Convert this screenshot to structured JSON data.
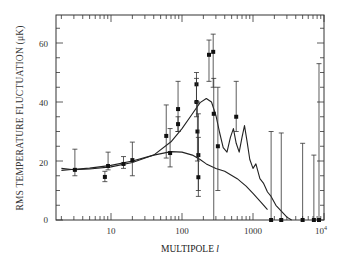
{
  "chart_data": {
    "type": "scatter",
    "title": "",
    "xlabel": "MULTIPOLE l",
    "ylabel": "RMS TEMPERATURE FLUCTUATION (μK)",
    "xscale": "log",
    "xlim": [
      1.7,
      10000
    ],
    "ylim": [
      0,
      69
    ],
    "x_ticks": [
      10,
      100,
      1000,
      10000
    ],
    "x_tick_labels": [
      "10",
      "100",
      "1000",
      "10⁴"
    ],
    "y_ticks": [
      0,
      20,
      40,
      60
    ],
    "y_tick_labels": [
      "0",
      "20",
      "40",
      "60"
    ],
    "grid": false,
    "legend": null,
    "series": [
      {
        "name": "measurements",
        "kind": "points_with_errorbars",
        "points": [
          {
            "l": 3.1,
            "T": 17.0,
            "lo": 15.0,
            "hi": 24.0
          },
          {
            "l": 8.2,
            "T": 14.6,
            "lo": 13.0,
            "hi": 16.5
          },
          {
            "l": 9.1,
            "T": 18.3,
            "lo": 17.0,
            "hi": 23.0
          },
          {
            "l": 15,
            "T": 19.0,
            "lo": 17.5,
            "hi": 21.5
          },
          {
            "l": 20,
            "T": 20.3,
            "lo": 15.0,
            "hi": 26.4
          },
          {
            "l": 60,
            "T": 28.5,
            "lo": 21.0,
            "hi": 39.0
          },
          {
            "l": 68,
            "T": 22.7,
            "lo": 18.0,
            "hi": 31.0
          },
          {
            "l": 88,
            "T": 37.6,
            "lo": 30.0,
            "hi": 47.0
          },
          {
            "l": 88,
            "T": 32.5,
            "lo": 30.0,
            "hi": 35.0
          },
          {
            "l": 160,
            "T": 46.0,
            "lo": 40.0,
            "hi": 50.0
          },
          {
            "l": 160,
            "T": 40.0,
            "lo": 35.0,
            "hi": 48.0
          },
          {
            "l": 165,
            "T": 30.0,
            "lo": 20.0,
            "hi": 40.0
          },
          {
            "l": 170,
            "T": 22.0,
            "lo": 8.0,
            "hi": 36.0
          },
          {
            "l": 170,
            "T": 14.5,
            "lo": 10.0,
            "hi": 28.0
          },
          {
            "l": 240,
            "T": 56.0,
            "lo": 47.0,
            "hi": 61.0
          },
          {
            "l": 275,
            "T": 57.0,
            "lo": 45.0,
            "hi": 63.0
          },
          {
            "l": 280,
            "T": 36.0,
            "lo": 0.0,
            "hi": 48.0
          },
          {
            "l": 320,
            "T": 25.0,
            "lo": 10.0,
            "hi": 45.0
          },
          {
            "l": 580,
            "T": 35.0,
            "lo": 30.0,
            "hi": 47.0
          },
          {
            "l": 1800,
            "T": 0.0,
            "lo": 0.0,
            "hi": 30.0
          },
          {
            "l": 2500,
            "T": 0.0,
            "lo": 0.0,
            "hi": 29.5
          },
          {
            "l": 5000,
            "T": 0.0,
            "lo": 0.0,
            "hi": 26.0
          },
          {
            "l": 7200,
            "T": 0.0,
            "lo": 0.0,
            "hi": 22.0
          },
          {
            "l": 8500,
            "T": 0.0,
            "lo": 0.0,
            "hi": 53.0
          }
        ]
      },
      {
        "name": "model-peaked",
        "kind": "line",
        "l": [
          2,
          3,
          5,
          10,
          20,
          40,
          70,
          100,
          140,
          180,
          220,
          260,
          300,
          340,
          380,
          430,
          480,
          530,
          580,
          640,
          700,
          760,
          820,
          900,
          1000,
          1100,
          1250,
          1400,
          1600,
          1800,
          2100,
          2500,
          3000,
          3500
        ],
        "T": [
          17.5,
          17.0,
          17.3,
          18.0,
          19.5,
          22.0,
          26.5,
          31.0,
          36.0,
          39.8,
          41.2,
          40.0,
          35.5,
          29.5,
          24.5,
          23.0,
          28.0,
          31.0,
          26.0,
          23.0,
          28.0,
          32.0,
          27.0,
          20.5,
          17.5,
          19.0,
          14.0,
          12.5,
          9.5,
          8.0,
          5.0,
          3.0,
          1.0,
          0.0
        ]
      },
      {
        "name": "model-flat",
        "kind": "line",
        "l": [
          2,
          3,
          5,
          10,
          20,
          40,
          70,
          100,
          140,
          180,
          220,
          300,
          400,
          600,
          800,
          1000,
          1300,
          1600
        ],
        "T": [
          16.8,
          17.2,
          17.6,
          18.5,
          20.0,
          22.0,
          23.2,
          23.0,
          22.0,
          20.5,
          19.0,
          17.5,
          16.5,
          14.0,
          11.5,
          9.0,
          6.0,
          3.5
        ]
      }
    ]
  },
  "axes": {
    "ylabel": "RMS TEMPERATURE FLUCTUATION (μK)",
    "xlabel_text": "MULTIPOLE ",
    "xlabel_var": "l",
    "xticks": [
      "10",
      "100",
      "1000",
      "10"
    ],
    "xtick_exp": "4",
    "yticks": [
      "0",
      "20",
      "40",
      "60"
    ]
  }
}
